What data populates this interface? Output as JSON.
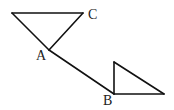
{
  "diagram": {
    "type": "geometry-figure",
    "labels": {
      "A": "A",
      "B": "B",
      "C": "C"
    },
    "points": {
      "P_topleft": [
        12,
        13
      ],
      "C": [
        83,
        13
      ],
      "A": [
        49,
        50
      ],
      "B": [
        114,
        94
      ],
      "Q_top": [
        114,
        62
      ],
      "R_right": [
        164,
        94
      ]
    },
    "segments": [
      [
        "P_topleft",
        "C"
      ],
      [
        "C",
        "A"
      ],
      [
        "P_topleft",
        "A"
      ],
      [
        "A",
        "B"
      ],
      [
        "B",
        "Q_top"
      ],
      [
        "Q_top",
        "R_right"
      ],
      [
        "B",
        "R_right"
      ]
    ],
    "colors": {
      "stroke": "#111111",
      "text": "#222222",
      "background": "#ffffff"
    }
  }
}
